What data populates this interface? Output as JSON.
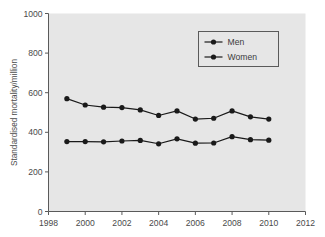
{
  "chart_data": {
    "type": "line",
    "title": "",
    "subtitle": "",
    "xlabel": "",
    "ylabel": "Standardised mortality/million",
    "xlim": [
      1998,
      2012
    ],
    "ylim": [
      0,
      1000
    ],
    "xticks": [
      1998,
      2000,
      2002,
      2004,
      2006,
      2008,
      2010,
      2012
    ],
    "yticks": [
      0,
      200,
      400,
      600,
      800,
      1000
    ],
    "xtick_labels": [
      "1998",
      "2000",
      "2002",
      "2004",
      "2006",
      "2008",
      "2010",
      "2012"
    ],
    "ytick_labels": [
      "0",
      "200",
      "400",
      "600",
      "800",
      "1000"
    ],
    "grid": false,
    "legend_position": "upper right",
    "x": [
      1999,
      2000,
      2001,
      2002,
      2003,
      2004,
      2005,
      2006,
      2007,
      2008,
      2009,
      2010
    ],
    "series": [
      {
        "name": "Men",
        "marker": "circle",
        "color": "#1a1a1a",
        "values": [
          570,
          538,
          527,
          525,
          513,
          485,
          508,
          467,
          471,
          508,
          478,
          467
        ]
      },
      {
        "name": "Women",
        "marker": "circle",
        "color": "#1a1a1a",
        "values": [
          353,
          353,
          352,
          356,
          359,
          342,
          367,
          345,
          346,
          378,
          363,
          360
        ]
      }
    ],
    "annotations": []
  },
  "legend": {
    "entries": [
      {
        "label": "Men"
      },
      {
        "label": "Women"
      }
    ]
  },
  "colors": {
    "plot_background": "#e6e6e6",
    "page_background": "#ffffff",
    "axis": "#5a5a5a",
    "series": "#1a1a1a",
    "legend_border": "#5a5a5a",
    "legend_background": "#e6e6e6",
    "text": "#4a4a4a"
  },
  "axes": {
    "y_axis_title": "Standardised mortality/million"
  }
}
